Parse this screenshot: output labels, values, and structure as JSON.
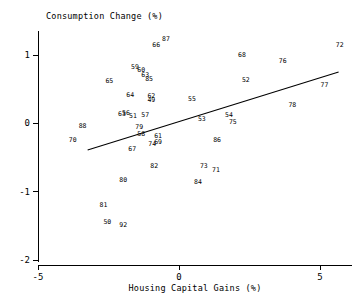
{
  "chart_data": {
    "type": "scatter",
    "title": "",
    "xlabel": "Housing Capital Gains (%)",
    "ylabel": "Consumption Change (%)",
    "xlim": [
      -5.6,
      6.0
    ],
    "ylim": [
      -2.15,
      1.35
    ],
    "xticks": [
      -5,
      0,
      5
    ],
    "xtick_labels": [
      "-5",
      "0",
      "5"
    ],
    "yticks": [
      1,
      0,
      -1,
      -2
    ],
    "ytick_labels": [
      "1",
      "0",
      "-1",
      "-2"
    ],
    "grid": false,
    "legend": "none",
    "point_style": "text-label",
    "points": [
      {
        "label": "87",
        "x": -0.46,
        "y": 1.23
      },
      {
        "label": "66",
        "x": -0.81,
        "y": 1.15
      },
      {
        "label": "72",
        "x": 5.7,
        "y": 1.15
      },
      {
        "label": "68",
        "x": 2.23,
        "y": 1.0
      },
      {
        "label": "59",
        "x": -1.56,
        "y": 0.82
      },
      {
        "label": "76",
        "x": 3.68,
        "y": 0.91
      },
      {
        "label": "60",
        "x": -1.34,
        "y": 0.77
      },
      {
        "label": "63",
        "x": -1.2,
        "y": 0.71
      },
      {
        "label": "85",
        "x": -1.06,
        "y": 0.65
      },
      {
        "label": "52",
        "x": 2.37,
        "y": 0.63
      },
      {
        "label": "65",
        "x": -2.47,
        "y": 0.62
      },
      {
        "label": "77",
        "x": 5.16,
        "y": 0.56
      },
      {
        "label": "64",
        "x": -1.73,
        "y": 0.41
      },
      {
        "label": "62",
        "x": -0.98,
        "y": 0.39
      },
      {
        "label": "49",
        "x": -0.98,
        "y": 0.34
      },
      {
        "label": "55",
        "x": 0.46,
        "y": 0.36
      },
      {
        "label": "78",
        "x": 4.02,
        "y": 0.26
      },
      {
        "label": "63b",
        "x": -2.02,
        "y": 0.13
      },
      {
        "label": "56",
        "x": -1.88,
        "y": 0.15
      },
      {
        "label": "51",
        "x": -1.63,
        "y": 0.1
      },
      {
        "label": "57",
        "x": -1.2,
        "y": 0.12
      },
      {
        "label": "54",
        "x": 1.77,
        "y": 0.12
      },
      {
        "label": "53",
        "x": 0.81,
        "y": 0.06
      },
      {
        "label": "75",
        "x": 1.91,
        "y": 0.01
      },
      {
        "label": "88",
        "x": -3.42,
        "y": -0.04
      },
      {
        "label": "79",
        "x": -1.41,
        "y": -0.05
      },
      {
        "label": "58",
        "x": -1.34,
        "y": -0.16
      },
      {
        "label": "61",
        "x": -0.74,
        "y": -0.19
      },
      {
        "label": "70",
        "x": -3.77,
        "y": -0.25
      },
      {
        "label": "86",
        "x": 1.35,
        "y": -0.24
      },
      {
        "label": "74",
        "x": -0.95,
        "y": -0.3
      },
      {
        "label": "69",
        "x": -0.74,
        "y": -0.28
      },
      {
        "label": "67",
        "x": -1.66,
        "y": -0.38
      },
      {
        "label": "82",
        "x": -0.88,
        "y": -0.63
      },
      {
        "label": "73",
        "x": 0.88,
        "y": -0.63
      },
      {
        "label": "71",
        "x": 1.31,
        "y": -0.69
      },
      {
        "label": "80",
        "x": -1.98,
        "y": -0.83
      },
      {
        "label": "84",
        "x": 0.67,
        "y": -0.86
      },
      {
        "label": "81",
        "x": -2.68,
        "y": -1.2
      },
      {
        "label": "50",
        "x": -2.54,
        "y": -1.44
      },
      {
        "label": "92",
        "x": -1.98,
        "y": -1.49
      }
    ],
    "trend_line": {
      "x1": -3.24,
      "y1": -0.39,
      "x2": 5.66,
      "y2": 0.75
    }
  }
}
